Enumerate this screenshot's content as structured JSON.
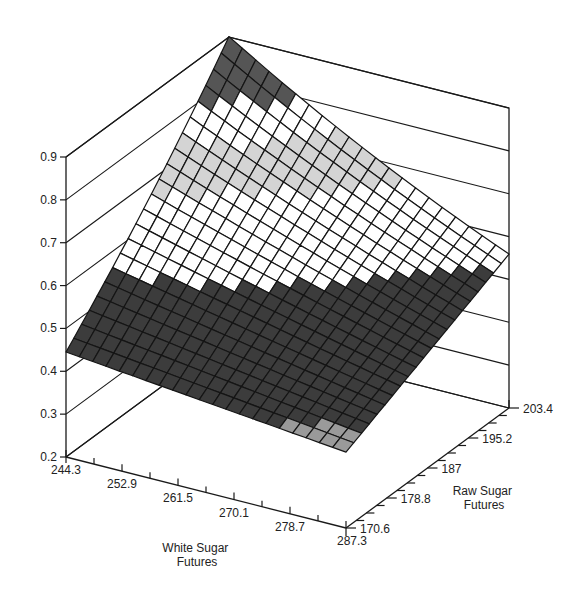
{
  "chart_data": {
    "type": "surface3d",
    "title": "",
    "xlabel": "White Sugar Futures",
    "ylabel": "Raw Sugar Futures",
    "zlabel": "",
    "x_ticks": [
      "244.3",
      "252.9",
      "261.5",
      "270.1",
      "278.7",
      "287.3"
    ],
    "y_ticks": [
      "170.6",
      "178.8",
      "187",
      "195.2",
      "203.4"
    ],
    "z_ticks": [
      "0.2",
      "0.3",
      "0.4",
      "0.5",
      "0.6",
      "0.7",
      "0.8",
      "0.9"
    ],
    "xlim": [
      244.3,
      287.3
    ],
    "ylim": [
      170.6,
      203.4
    ],
    "zlim": [
      0.2,
      0.9
    ],
    "grid_size": 21,
    "corner_values": {
      "x_min_y_min": 0.445,
      "x_max_y_min": 0.377,
      "x_min_y_max": 0.874,
      "x_max_y_max": 0.559
    },
    "shading_levels": [
      0.4,
      0.55,
      0.67,
      0.74,
      0.8
    ],
    "shading_colors": [
      "#9a9a9a",
      "#3c3c3c",
      "#ffffff",
      "#d4d4d4",
      "#ffffff",
      "#555555"
    ]
  },
  "colors": {
    "line": "#1a1a1a",
    "background": "#ffffff"
  }
}
